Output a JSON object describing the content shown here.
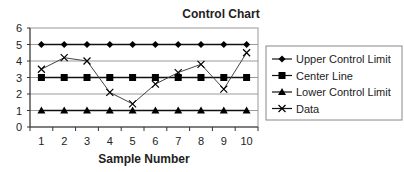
{
  "chart_data": {
    "type": "line",
    "title": "Control Chart",
    "xlabel": "Sample Number",
    "ylabel": "",
    "categories": [
      "1",
      "2",
      "3",
      "4",
      "5",
      "6",
      "7",
      "8",
      "9",
      "10"
    ],
    "ylim": [
      0,
      6
    ],
    "yticks": [
      0,
      1,
      2,
      3,
      4,
      5,
      6
    ],
    "grid": true,
    "legend_position": "right",
    "series": [
      {
        "name": "Upper Control Limit",
        "marker": "diamond",
        "values": [
          5,
          5,
          5,
          5,
          5,
          5,
          5,
          5,
          5,
          5
        ]
      },
      {
        "name": "Center Line",
        "marker": "square",
        "values": [
          3,
          3,
          3,
          3,
          3,
          3,
          3,
          3,
          3,
          3
        ]
      },
      {
        "name": "Lower Control Limit",
        "marker": "triangle",
        "values": [
          1,
          1,
          1,
          1,
          1,
          1,
          1,
          1,
          1,
          1
        ]
      },
      {
        "name": "Data",
        "marker": "x",
        "values": [
          3.5,
          4.2,
          4.0,
          2.1,
          1.4,
          2.6,
          3.3,
          3.8,
          2.3,
          4.5
        ]
      }
    ]
  }
}
